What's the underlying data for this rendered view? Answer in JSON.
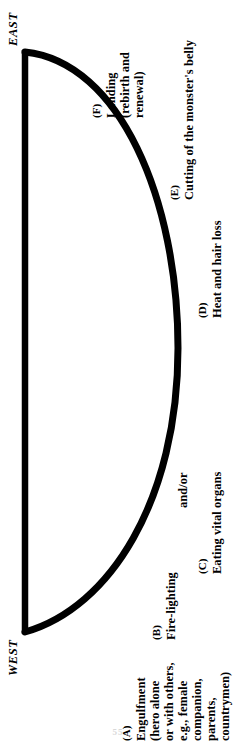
{
  "figure": {
    "compass": {
      "east_label": "EAST",
      "west_label": "WEST"
    },
    "arc": {
      "stroke_color": "#000000",
      "background_color": "#ffffff",
      "chord_x": 25,
      "chord_top_y": 52,
      "chord_bottom_y": 632,
      "arc_peak_x": 177,
      "stroke_width": 6,
      "description": "Vertical chord on the left joined by a bow-shaped arc bulging to the right"
    },
    "stages": [
      {
        "key": "(A)",
        "lines": [
          "Engulfment",
          "(hero alone",
          "or with others,",
          "e.g., female",
          "companion,",
          "parents,",
          "countrymen)"
        ]
      },
      {
        "key": "(B)",
        "lines": [
          "Fire-lighting"
        ]
      },
      {
        "key": "(C)",
        "lines": [
          "Eating vital organs"
        ]
      },
      {
        "key": "(D)",
        "lines": [
          "Heat and hair loss"
        ]
      },
      {
        "key": "(E)",
        "lines": [
          "Cutting of the monster's belly"
        ]
      },
      {
        "key": "(F)",
        "lines": [
          "Landing",
          "(rebirth and",
          "renewal)"
        ]
      }
    ],
    "connector_text": "and/or",
    "page_number": "55"
  }
}
